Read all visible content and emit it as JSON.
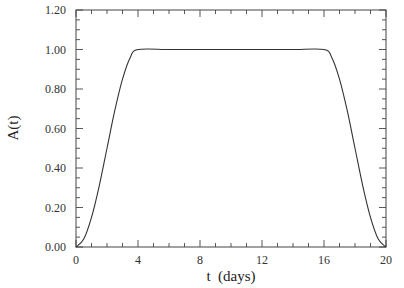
{
  "chart_data": {
    "type": "line",
    "title": "",
    "xlabel": "t  (days)",
    "ylabel": "A(t)",
    "xlim": [
      0,
      20
    ],
    "ylim": [
      0,
      1.2
    ],
    "xticks": [
      0,
      4,
      8,
      12,
      16,
      20
    ],
    "xtick_labels": [
      "0",
      "4",
      "8",
      "12",
      "16",
      "20"
    ],
    "yticks": [
      0,
      0.2,
      0.4,
      0.6,
      0.8,
      1.0,
      1.2
    ],
    "ytick_labels": [
      "0.00",
      "0.20",
      "0.40",
      "0.60",
      "0.80",
      "1.00",
      "1.20"
    ],
    "x_minor_per_major": 4,
    "y_minor_per_major": 4,
    "grid": false,
    "legend": null,
    "series": [
      {
        "name": "A(t)",
        "color": "#333333",
        "x": [
          0,
          0.5,
          1,
          1.5,
          2,
          2.5,
          3,
          3.5,
          4,
          6,
          8,
          10,
          12,
          14,
          16,
          16.5,
          17,
          17.5,
          18,
          18.5,
          19,
          19.5,
          20
        ],
        "y": [
          0.0,
          0.04,
          0.15,
          0.31,
          0.5,
          0.69,
          0.85,
          0.96,
          1.0,
          1.0,
          1.0,
          1.0,
          1.0,
          1.0,
          1.0,
          0.96,
          0.85,
          0.69,
          0.5,
          0.31,
          0.15,
          0.04,
          0.0
        ]
      }
    ]
  }
}
